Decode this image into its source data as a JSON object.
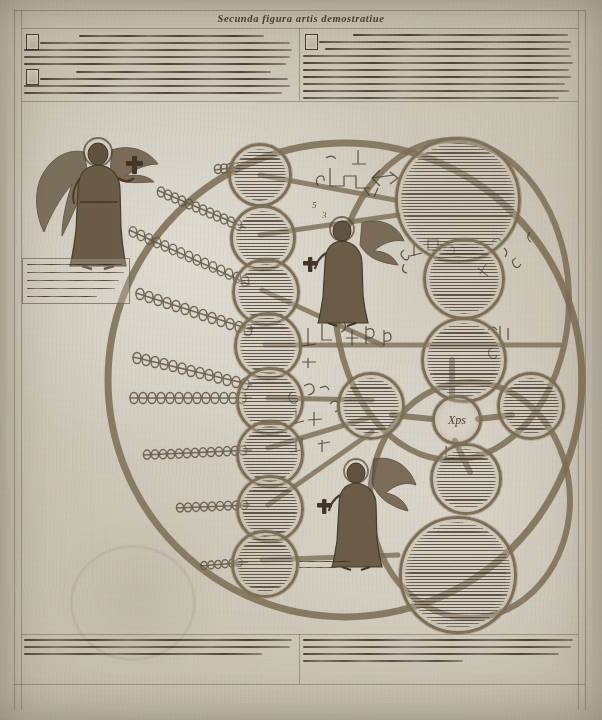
{
  "manuscript": {
    "title": "Secunda figura artis demostratiue",
    "folio_label": ""
  },
  "header": {
    "left_block": {
      "name": "left-header-paragraphs",
      "paragraphs": [
        {
          "initial": "V",
          "text": "Vtra hec ordo est alio ordine septiformi comparari respectiue vnde hoc sequitur quod vnus ordo angelicus secundum alium ordinem angelicum attingitur et declaratur cum aliqua proprietate communi quam Deus in eis et per eos operatur mirabiliter et ordinatissime gloriose et sine fine sicut scriptum est Amen."
        },
        {
          "initial": "Q",
          "text": "Quod quidem probari potest per demonstrationem in qua ista figura considerabilis est per ipsas disponentium rationes de ordinibus angelorum intelligibiliter de bonitate magnitudine eternitate potestate sapientia voluntate virtute veritate et gloria secundum modum perfectissimum. Amen."
        }
      ]
    },
    "right_block": {
      "name": "right-header-paragraphs",
      "paragraphs": [
        {
          "initial": "A",
          "text": "Angeli sunt intellectus finiti et separati a materia, quorum essentia sapientia bonitas virtus largitas et cetera dignitates sunt in eis plurificate, et secundum diuersos gradus ordinantur hierarchice in nouem ordines, secundum quod Dionysius in libro de Celesti Hierarchia determinat et ostendit."
        },
        {
          "initial": "S",
          "text": "Sciendum est quod diuina bonitas de Celo influit omnibus creaturis et omnis intellectus illuminatur et clarificatur secundum quod de ipsa bonitate participat ascendendo ad ordinem superiorem, et sic ordinate ad Celum per contemplationem Creatoris, per quem Celestis Hierarchia scilicet ordinatissima ordinatur, et in qua gloriose in eternum Deus laudatur et benedicitur. Amen."
        }
      ]
    }
  },
  "footer": {
    "left_block": {
      "name": "left-footer-paragraph",
      "text": "Ista est secunda seu figura artis demostratiue, per quam declaratur quomodo angelica natura disponitur per gradus, et quomodo attingitur intellectus ad cognitionem ipsius per scalam ascensus et descensus. Amen."
    },
    "right_block": {
      "name": "right-footer-paragraph",
      "text": "Sequitur autem quod ista figura habet officium et proprietatem suam secundum ordinem contemplationis et perfectionis, in qua intellectus et voluntas et memoria conueniunt ad cognitionem et amorem ipsius summi Creatoris, et de ipsius gloria plena ostenditur contemplatio beata."
    }
  },
  "captions": {
    "left_angel": "Hic ostenditur angelus qui describitur in ista figura secundum quod cum magna reuerentia et cum gaudio assistit ante Deum et seruit ipsum in gloria.",
    "center_bottom": "Angelus primi ordinis"
  },
  "diagram": {
    "name": "lullian-wheel-diagram",
    "outer_ring": {
      "cx": 345,
      "cy": 380,
      "r": 237,
      "stroke": "#7d6f57",
      "stroke_width": 7
    },
    "inner_ring": {
      "cx": 435,
      "cy": 310,
      "rx": 118,
      "ry": 160
    },
    "chain_count": 9,
    "left_nodes_count": 9,
    "right_nodes_count": 6,
    "hub_glyph": "Xps",
    "left_node_texts": [
      "Seraphin — ordo primus hierarchie supreme, qui in amore Dei ardet sine fine.",
      "Cherubin — ordo secundus, plenitudo scientie et cognitionis diuine.",
      "Throni — ordo tertius, in quo Deus sedet et iudicat iustitiam suam.",
      "Dominationes — ordo quartus, qui dominatur super inferiores uirtutes.",
      "Virtutes — ordo quintus, per quem miracula et signa operantur.",
      "Potestates — ordo sextus, qui potestatem habet super demones.",
      "Principatus — ordo septimus, qui principatur super principes populorum.",
      "Archangeli — ordo octauus, qui maiora nuntiant mysteria.",
      "Angeli — ordo nonus, qui minora nuntiant et custodiunt homines."
    ],
    "right_node_texts": [
      "Bonitas magnitudo eternitas potestas sapientia uoluntas uirtus ueritas et gloria sunt principia absoluta huius artis, per que omnis creatura ad Creatorem reducitur et in ipso quiescit gloriose sine fine. Amen.",
      "Differentia concordantia contrarietas principium medium finis maioritas equalitas et minoritas sunt principia relata.",
      "Vtrum quid de quo quare quantum quale quando ubi quomodo et cum quo sunt regule generales huius artis.",
      "Deus angelus celum homo imaginatiua sensitiua uegetatiua elementatiua et instrumentatiua sunt subiecta.",
      "Iustitia prudentia fortitudo temperantia fides spes caritas et patientia sunt uirtutes.",
      "Auaritia gula luxuria superbia accidia inuidia et ira sunt uitia, que contrariantur uirtutibus et per contemplationem destruuntur in anima fideli. Amen."
    ]
  },
  "marginal_glyphs": {
    "cluster_top": "E T  Ʒ Ƨ",
    "cluster_mid": "F T   R I E",
    "cluster_low": "B F   Ƨ R",
    "numeral_top": "5",
    "numeral_mid": "3"
  },
  "colors": {
    "parchment": "#d0cabc",
    "ink": "#3a2e22",
    "diagram_stroke": "#7d6f57",
    "angel_robe": "#6a5b46"
  }
}
